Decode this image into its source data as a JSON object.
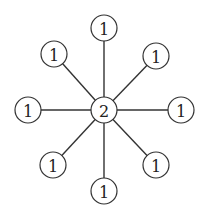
{
  "diagram": {
    "type": "star-graph",
    "colors": {
      "background": "#ffffff",
      "stroke": "#333333",
      "text": "#222222"
    },
    "node_radius": 13,
    "center": {
      "id": "center",
      "label": "2",
      "x": 104,
      "y": 110
    },
    "leaves": [
      {
        "id": "top",
        "label": "1",
        "x": 104,
        "y": 28
      },
      {
        "id": "top-right",
        "label": "1",
        "x": 156,
        "y": 56
      },
      {
        "id": "right",
        "label": "1",
        "x": 181,
        "y": 110
      },
      {
        "id": "bottom-right",
        "label": "1",
        "x": 156,
        "y": 165
      },
      {
        "id": "bottom",
        "label": "1",
        "x": 104,
        "y": 191
      },
      {
        "id": "bottom-left",
        "label": "1",
        "x": 53,
        "y": 165
      },
      {
        "id": "left",
        "label": "1",
        "x": 28,
        "y": 110
      },
      {
        "id": "top-left",
        "label": "1",
        "x": 54,
        "y": 54
      }
    ]
  }
}
